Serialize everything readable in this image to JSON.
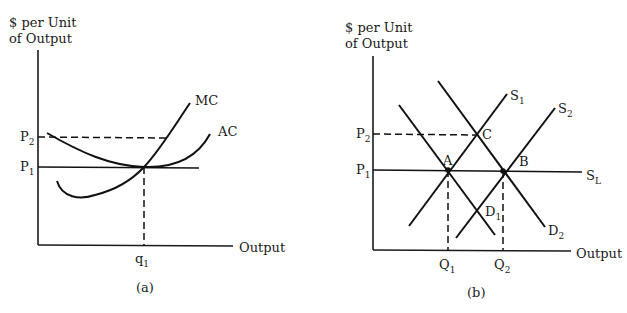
{
  "panel_a": {
    "caption": "(a)",
    "y_axis_label_line1": "$ per Unit",
    "y_axis_label_line2": "of Output",
    "x_axis_label": "Output",
    "price_labels": [
      {
        "base": "P",
        "sub": "2"
      },
      {
        "base": "P",
        "sub": "1"
      }
    ],
    "quantity_labels": [
      {
        "base": "q",
        "sub": "1"
      }
    ],
    "curves": [
      {
        "name": "MC",
        "label": "MC"
      },
      {
        "name": "AC",
        "label": "AC"
      }
    ]
  },
  "panel_b": {
    "caption": "(b)",
    "y_axis_label_line1": "$ per Unit",
    "y_axis_label_line2": "of Output",
    "x_axis_label": "Output",
    "price_labels": [
      {
        "base": "P",
        "sub": "2"
      },
      {
        "base": "P",
        "sub": "1"
      }
    ],
    "quantity_labels": [
      {
        "base": "Q",
        "sub": "1"
      },
      {
        "base": "Q",
        "sub": "2"
      }
    ],
    "curves": [
      {
        "name": "S1",
        "base": "S",
        "sub": "1"
      },
      {
        "name": "S2",
        "base": "S",
        "sub": "2"
      },
      {
        "name": "SL",
        "base": "S",
        "sub": "L"
      },
      {
        "name": "D1",
        "base": "D",
        "sub": "1"
      },
      {
        "name": "D2",
        "base": "D",
        "sub": "2"
      }
    ],
    "points": [
      {
        "label": "A"
      },
      {
        "label": "B"
      },
      {
        "label": "C"
      }
    ]
  }
}
